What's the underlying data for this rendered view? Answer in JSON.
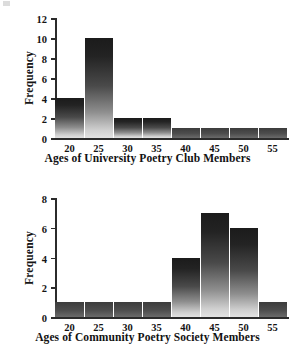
{
  "chart_data": [
    {
      "type": "bar",
      "id": "university-poetry-club",
      "title": "",
      "xlabel": "Ages of University Poetry Club Members",
      "ylabel": "Frequency",
      "categories": [
        "20",
        "25",
        "30",
        "35",
        "40",
        "45",
        "50",
        "55"
      ],
      "values": [
        4,
        10,
        2,
        2,
        1,
        1,
        1,
        1
      ],
      "ylim": [
        0,
        12
      ],
      "yticks": [
        "0",
        "2",
        "4",
        "6",
        "8",
        "10",
        "12"
      ],
      "ytick_values": [
        0,
        2,
        4,
        6,
        8,
        10,
        12
      ],
      "grid": false,
      "legend": "none"
    },
    {
      "type": "bar",
      "id": "community-poetry-society",
      "title": "",
      "xlabel": "Ages of Community Poetry Society Members",
      "ylabel": "Frequency",
      "categories": [
        "20",
        "25",
        "30",
        "35",
        "40",
        "45",
        "50",
        "55"
      ],
      "values": [
        1,
        1,
        1,
        1,
        4,
        7,
        6,
        1
      ],
      "ylim": [
        0,
        8
      ],
      "yticks": [
        "0",
        "2",
        "4",
        "6",
        "8"
      ],
      "ytick_values": [
        0,
        2,
        4,
        6,
        8
      ],
      "grid": false,
      "legend": "none"
    }
  ],
  "colors": {
    "axis": "#2b2b2b",
    "text": "#141414",
    "bar_top": "#1b1b1b",
    "bar_bottom": "#e2e2e2",
    "background": "#ffffff"
  }
}
